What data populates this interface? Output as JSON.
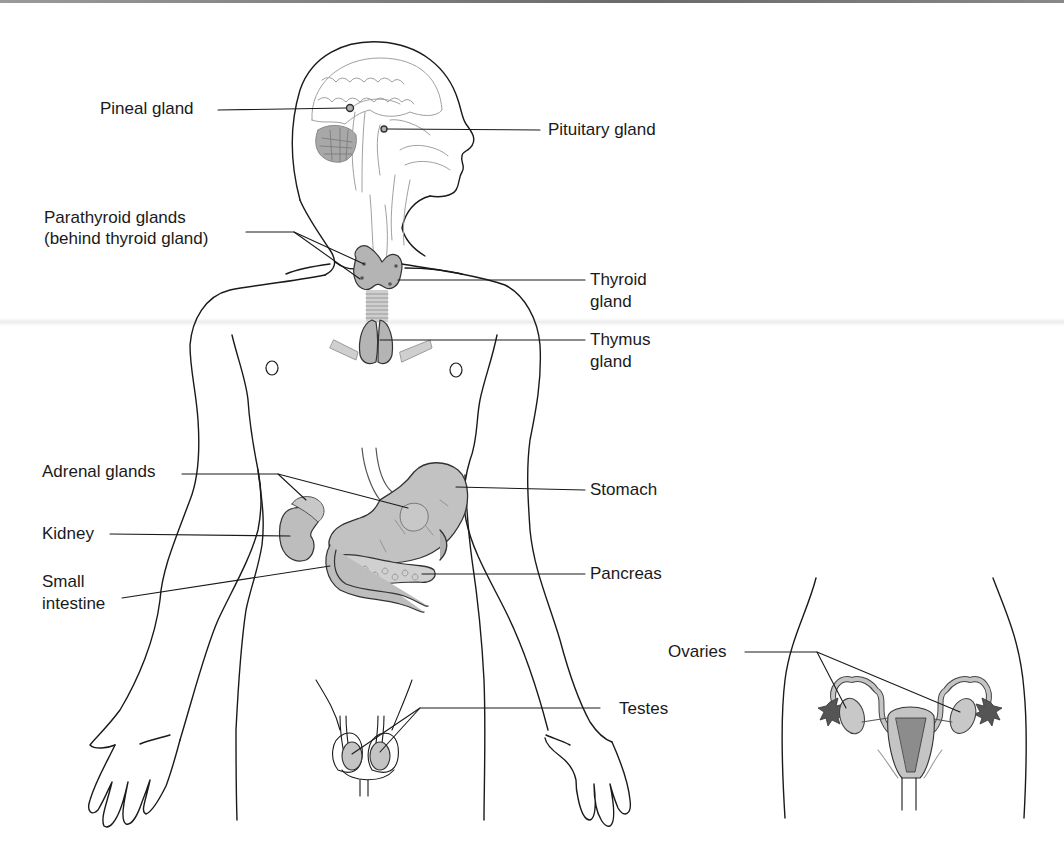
{
  "diagram": {
    "colors": {
      "outline": "#1a1a1a",
      "organ_fill": "#b8b8b8",
      "organ_dark": "#8c8c8c",
      "brain_line": "#9a9a9a",
      "leader_line": "#1a1a1a",
      "background": "#ffffff"
    },
    "labels": {
      "pineal": "Pineal gland",
      "pituitary": "Pituitary gland",
      "parathyroid_line1": "Parathyroid glands",
      "parathyroid_line2": "(behind thyroid gland)",
      "thyroid_line1": "Thyroid",
      "thyroid_line2": "gland",
      "thymus_line1": "Thymus",
      "thymus_line2": "gland",
      "adrenal": "Adrenal glands",
      "kidney": "Kidney",
      "small_intestine_line1": "Small",
      "small_intestine_line2": "intestine",
      "stomach": "Stomach",
      "pancreas": "Pancreas",
      "testes": "Testes",
      "ovaries": "Ovaries"
    }
  }
}
